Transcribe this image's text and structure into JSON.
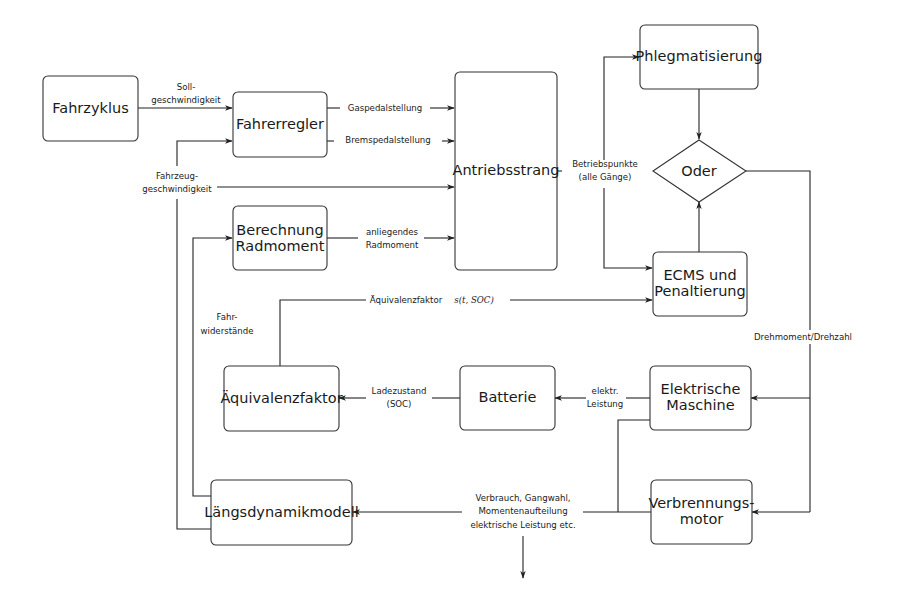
{
  "diagram": {
    "nodes": {
      "fahrzyklus": {
        "label": "Fahrzyklus"
      },
      "fahrerregler": {
        "label": "Fahrerregler"
      },
      "berechnung_radmoment": {
        "line1": "Berechnung",
        "line2": "Radmoment"
      },
      "antriebsstrang": {
        "label": "Antriebsstrang"
      },
      "phlegmatisierung": {
        "label": "Phlegmatisierung"
      },
      "oder": {
        "label": "Oder"
      },
      "ecms": {
        "line1": "ECMS und",
        "line2": "Penaltierung"
      },
      "aequivalenzfaktor": {
        "label": "Äquivalenzfaktor"
      },
      "batterie": {
        "label": "Batterie"
      },
      "elektrische_maschine": {
        "line1": "Elektrische",
        "line2": "Maschine"
      },
      "verbrennungsmotor": {
        "line1": "Verbrennungs-",
        "line2": "motor"
      },
      "laengsdynamikmodell": {
        "label": "Längsdynamikmodell"
      }
    },
    "edges": {
      "sollgeschwindigkeit": {
        "line1": "Soll-",
        "line2": "geschwindigkeit"
      },
      "gaspedalstellung": {
        "label": "Gaspedalstellung"
      },
      "bremspedalstellung": {
        "label": "Bremspedalstellung"
      },
      "fahrzeuggeschwindigkeit": {
        "line1": "Fahrzeug-",
        "line2": "geschwindigkeit"
      },
      "anliegendes_radmoment": {
        "line1": "anliegendes",
        "line2": "Radmoment"
      },
      "betriebspunkte": {
        "line1": "Betriebspunkte",
        "line2": "(alle Gänge)"
      },
      "aequivalenzfaktor_signal": {
        "text": "Äquivalenzfaktor",
        "math": "s(t, SOC)"
      },
      "fahrwiderstaende": {
        "line1": "Fahr-",
        "line2": "widerstände"
      },
      "drehmoment_drehzahl": {
        "label": "Drehmoment/Drehzahl"
      },
      "ladezustand": {
        "line1": "Ladezustand",
        "line2": "(SOC)"
      },
      "elektr_leistung": {
        "line1": "elektr.",
        "line2": "Leistung"
      },
      "verbrauch": {
        "line1": "Verbrauch, Gangwahl,",
        "line2": "Momentenaufteilung",
        "line3": "elektrische Leistung etc."
      }
    }
  }
}
